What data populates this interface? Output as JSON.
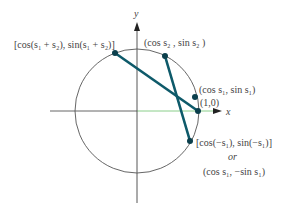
{
  "diagram": {
    "axes": {
      "x_label": "x",
      "y_label": "y"
    },
    "colors": {
      "segment": "#0e5a6a",
      "point": "#0b3f4c",
      "circle": "#555555",
      "axis": "#333333",
      "x_axis_tint": "#7ec87e"
    },
    "labels": {
      "p_sum": "[cos(s₁ + s₂), sin(s₁ + s₂)]",
      "p_s2": "(cos s₂ , sin s₂ )",
      "p_s1": "(cos s₁, sin s₁)",
      "origin_one": "(1,0)",
      "p_neg_s1": "[cos(−s₁), sin(−s₁)]",
      "or_text": "or",
      "p_neg_s1_alt": "(cos s₁, −sin s₁)"
    },
    "segments": [
      {
        "from": "p_sum",
        "to": "origin_one"
      },
      {
        "from": "p_s2",
        "to": "p_neg_s1"
      }
    ]
  }
}
